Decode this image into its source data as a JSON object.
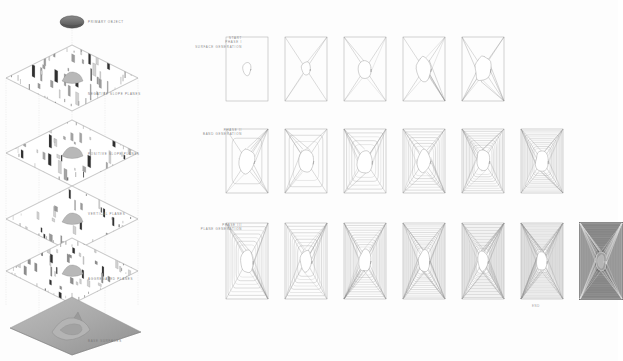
{
  "diagram": {
    "title_labels": {
      "primary_object": "PRIMARY OBJECT",
      "negative_slope_planes": "NEGATIVE SLOPE PLANES",
      "positive_slope_planes": "POSITIVE SLOPE PLANES",
      "vertical_planes": "VERTICAL PLANES",
      "aggregated_planes": "AGGREGATED PLANES",
      "base_surfaces": "BASE SURFACES"
    },
    "phase_labels": {
      "phase1_line1": "START",
      "phase1_line2": "PHASE I",
      "phase1_line3": "SURFACE GENERATION",
      "phase2_line1": "PHASE II",
      "phase2_line2": "BAND GENERATION",
      "phase3_line1": "PHASE III",
      "phase3_line2": "PLANE GENERATION",
      "end": "END"
    },
    "colors": {
      "background": "#fdfdfd",
      "stroke": "#8f8f8f",
      "stroke_light": "#b9b9b9",
      "text": "#7b7b7b",
      "fill_dark": "#5a5a5a",
      "fill_mid": "#9a9a9a",
      "fill_light": "#cfcfcf",
      "panel_dark_bg": "#6e6e6e"
    },
    "iso_stack": {
      "layers": [
        {
          "name": "primary-object",
          "kind": "blob"
        },
        {
          "name": "negative-slope-planes",
          "kind": "fin-plane",
          "density": 34,
          "finlen": 14
        },
        {
          "name": "positive-slope-planes",
          "kind": "fin-plane",
          "density": 30,
          "finlen": 11
        },
        {
          "name": "vertical-planes",
          "kind": "fin-plane",
          "density": 26,
          "finlen": 9
        },
        {
          "name": "aggregated-planes",
          "kind": "fin-plane",
          "density": 40,
          "finlen": 8
        },
        {
          "name": "base-surfaces",
          "kind": "terrain"
        }
      ]
    },
    "matrix": {
      "row1": {
        "name": "surface-generation",
        "panel_count": 5,
        "steps": [
          {
            "step": 1,
            "rays": 0,
            "blob": 0.4,
            "weight": 0.25
          },
          {
            "step": 2,
            "rays": 2,
            "blob": 0.45,
            "weight": 0.35
          },
          {
            "step": 3,
            "rays": 4,
            "blob": 0.62,
            "weight": 0.5
          },
          {
            "step": 4,
            "rays": 7,
            "blob": 0.75,
            "weight": 0.7
          },
          {
            "step": 5,
            "rays": 9,
            "blob": 0.8,
            "weight": 0.85
          }
        ]
      },
      "row2": {
        "name": "band-generation",
        "panel_count": 6,
        "steps": [
          {
            "step": 1,
            "bands": 1,
            "rays": 8,
            "blob": 0.8
          },
          {
            "step": 2,
            "bands": 2,
            "rays": 9,
            "blob": 0.78
          },
          {
            "step": 3,
            "bands": 4,
            "rays": 11,
            "blob": 0.74
          },
          {
            "step": 4,
            "bands": 6,
            "rays": 13,
            "blob": 0.7
          },
          {
            "step": 5,
            "bands": 8,
            "rays": 15,
            "blob": 0.66
          },
          {
            "step": 6,
            "bands": 10,
            "rays": 17,
            "blob": 0.62
          }
        ]
      },
      "row3": {
        "name": "plane-generation",
        "panel_count": 7,
        "steps": [
          {
            "step": 1,
            "bands": 6,
            "rays": 14,
            "blob": 0.62,
            "dark": false
          },
          {
            "step": 2,
            "bands": 7,
            "rays": 12,
            "blob": 0.6,
            "dark": false
          },
          {
            "step": 3,
            "bands": 10,
            "rays": 20,
            "blob": 0.58,
            "dark": false
          },
          {
            "step": 4,
            "bands": 13,
            "rays": 26,
            "blob": 0.56,
            "dark": false
          },
          {
            "step": 5,
            "bands": 17,
            "rays": 34,
            "blob": 0.54,
            "dark": false
          },
          {
            "step": 6,
            "bands": 21,
            "rays": 44,
            "blob": 0.52,
            "dark": false
          },
          {
            "step": 7,
            "bands": 24,
            "rays": 52,
            "blob": 0.5,
            "dark": true
          }
        ]
      }
    }
  }
}
